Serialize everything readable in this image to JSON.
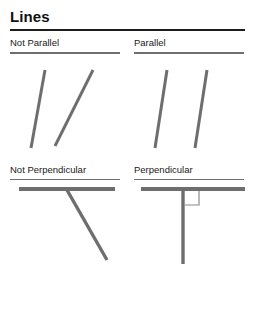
{
  "page": {
    "title": "Lines"
  },
  "colors": {
    "line_stroke": "#6e6e6e",
    "title_rule": "#1d1d1d",
    "section_rule": "#6f6f6f",
    "text": "#202020",
    "background": "#ffffff"
  },
  "sections": [
    {
      "key": "not_parallel",
      "label": "Not Parallel",
      "figure_name": "not-parallel-figure",
      "lines": [
        {
          "name": "line-left",
          "x1": 36,
          "y1": 16,
          "x2": 22,
          "y2": 94
        },
        {
          "name": "line-right",
          "x1": 84,
          "y1": 16,
          "x2": 46,
          "y2": 92
        }
      ],
      "angle_marker": null
    },
    {
      "key": "parallel",
      "label": "Parallel",
      "figure_name": "parallel-figure",
      "lines": [
        {
          "name": "line-left",
          "x1": 34,
          "y1": 16,
          "x2": 22,
          "y2": 94
        },
        {
          "name": "line-right",
          "x1": 74,
          "y1": 16,
          "x2": 62,
          "y2": 94
        }
      ],
      "angle_marker": null
    },
    {
      "key": "not_perpendicular",
      "label": "Not Perpendicular",
      "figure_name": "not-perpendicular-figure",
      "lines": [
        {
          "name": "line-horizontal",
          "x1": 10,
          "y1": 9,
          "x2": 106,
          "y2": 9
        },
        {
          "name": "line-diagonal",
          "x1": 58,
          "y1": 10,
          "x2": 98,
          "y2": 80
        }
      ],
      "angle_marker": null
    },
    {
      "key": "perpendicular",
      "label": "Perpendicular",
      "figure_name": "perpendicular-figure",
      "lines": [
        {
          "name": "line-horizontal",
          "x1": 8,
          "y1": 9,
          "x2": 112,
          "y2": 9
        },
        {
          "name": "line-vertical",
          "x1": 50,
          "y1": 9,
          "x2": 50,
          "y2": 84
        }
      ],
      "angle_marker": {
        "name": "right-angle-marker",
        "x": 52,
        "y": 11,
        "size": 14
      }
    }
  ]
}
